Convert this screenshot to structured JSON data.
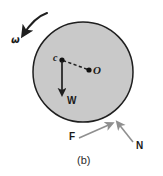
{
  "figure": {
    "caption": "(b)",
    "background_color": "#ffffff",
    "disk": {
      "name": "rotating-disk",
      "fill_color": "#c9c9c9",
      "stroke_color": "#1f1f1f",
      "center_x": 83,
      "center_y": 72,
      "radius": 50
    },
    "labels": {
      "omega": "ω",
      "center_of_mass": "c",
      "geometric_center": "O",
      "weight": "W",
      "friction": "F",
      "normal": "N"
    },
    "points": {
      "c": {
        "x": 62,
        "y": 60
      },
      "O": {
        "x": 89,
        "y": 70
      },
      "contact": {
        "x": 115,
        "y": 122
      }
    },
    "vectors": [
      {
        "name": "weight",
        "label": "W",
        "from_x": 62,
        "from_y": 60,
        "to_x": 62,
        "to_y": 97,
        "color": "#1f1f1f"
      },
      {
        "name": "friction",
        "label": "F",
        "from_x": 80,
        "from_y": 138,
        "to_x": 113,
        "to_y": 123,
        "color": "#8c8c8c"
      },
      {
        "name": "normal",
        "label": "N",
        "from_x": 134,
        "from_y": 143,
        "to_x": 117,
        "to_y": 121,
        "color": "#8c8c8c"
      },
      {
        "name": "angular-velocity",
        "label": "ω",
        "color": "#1f1f1f"
      }
    ],
    "connector": {
      "name": "c-to-O-dashed-line",
      "style": "dashed",
      "color": "#1f1f1f"
    }
  }
}
